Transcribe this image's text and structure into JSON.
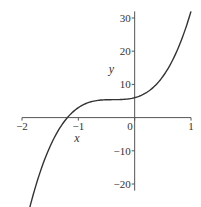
{
  "chart_data": {
    "type": "line",
    "title": "",
    "xlabel": "x",
    "ylabel": "y",
    "xlim": [
      -2,
      1
    ],
    "ylim": [
      -22,
      32
    ],
    "grid": false,
    "legend": null,
    "x_ticks": [
      -2,
      -1,
      0,
      1
    ],
    "y_ticks": [
      -20,
      -10,
      10,
      20,
      30
    ],
    "x_tick_labels": [
      "-2",
      "-1",
      "0",
      "1"
    ],
    "y_tick_labels": [
      "-20",
      "-10",
      "10",
      "20",
      "30"
    ],
    "series": [
      {
        "name": "y(x)",
        "color": "#333333",
        "x": [
          -2.0,
          -1.8,
          -1.6,
          -1.4,
          -1.35,
          -1.2,
          -1.0,
          -0.8,
          -0.6,
          -0.4,
          -0.2,
          0.0,
          0.2,
          0.4,
          0.6,
          0.8,
          1.0
        ],
        "y": [
          -22.0,
          -12.8,
          -6.0,
          -1.0,
          0.0,
          2.5,
          4.0,
          4.7,
          4.9,
          5.0,
          5.2,
          6.0,
          7.8,
          11.2,
          16.6,
          23.5,
          32.0
        ]
      }
    ]
  }
}
